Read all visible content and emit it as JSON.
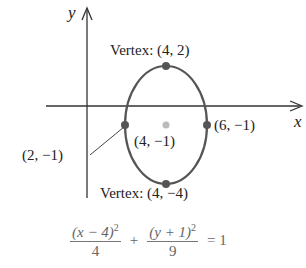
{
  "axes": {
    "x_label": "x",
    "y_label": "y"
  },
  "ellipse": {
    "center": {
      "label": "(4, −1)",
      "x": 4,
      "y": -1
    },
    "points": [
      {
        "name": "top-vertex",
        "label": "Vertex: (4, 2)",
        "x": 4,
        "y": 2
      },
      {
        "name": "bottom-vertex",
        "label": "Vertex: (4, −4)",
        "x": 4,
        "y": -4
      },
      {
        "name": "left-point",
        "label": "(2, −1)",
        "x": 2,
        "y": -1
      },
      {
        "name": "right-point",
        "label": "(6, −1)",
        "x": 6,
        "y": -1
      }
    ]
  },
  "equation": {
    "term1_num": "(x − 4)",
    "term1_exp": "2",
    "term1_den": "4",
    "plus": "+",
    "term2_num": "(y + 1)",
    "term2_exp": "2",
    "term2_den": "9",
    "equals": "= 1"
  },
  "colors": {
    "curve": "#555555",
    "axis": "#333333",
    "center": "#bbbbbb"
  }
}
